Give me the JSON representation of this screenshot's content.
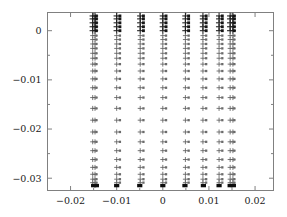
{
  "chart_data": {
    "type": "scatter",
    "title": "",
    "subtitle": "",
    "xlabel": "",
    "ylabel": "",
    "xlim": [
      -0.025,
      0.024
    ],
    "ylim": [
      -0.0325,
      0.0037
    ],
    "grid": false,
    "legend": null,
    "xticks": [
      -0.02,
      -0.01,
      0,
      0.01,
      0.02
    ],
    "xtick_labels": [
      "−0.02",
      "−0.01",
      "0",
      "0.01",
      "0.02"
    ],
    "yticks": [
      0,
      -0.01,
      -0.02,
      -0.03
    ],
    "ytick_labels": [
      "0",
      "−0.01",
      "−0.02",
      "−0.03"
    ],
    "minor_xticks": [
      -0.015,
      -0.005,
      0.005,
      0.015
    ],
    "minor_yticks": [
      -0.005,
      -0.015,
      -0.025
    ],
    "marker_styles": [
      "plus",
      "dot",
      "filled-square"
    ],
    "series": [
      {
        "name": "plus-columns",
        "marker": "plus",
        "x": [
          -0.0152,
          -0.0147,
          -0.01,
          -0.0049,
          0.0,
          0.0049,
          0.0087,
          0.0122,
          0.0146,
          0.0152
        ],
        "y_levels": [
          0.003,
          0.0024,
          0.0016,
          0.0008,
          0.0,
          -0.001,
          -0.0018,
          -0.0027,
          -0.0036,
          -0.0046,
          -0.0056,
          -0.0068,
          -0.0082,
          -0.0098,
          -0.0116,
          -0.0136,
          -0.0158,
          -0.0182,
          -0.0206,
          -0.0226,
          -0.0244,
          -0.0262,
          -0.0278,
          -0.0292,
          -0.0302,
          -0.0309
        ]
      },
      {
        "name": "dot-columns",
        "marker": "dot",
        "x": [
          -0.0144,
          -0.0093,
          -0.0042,
          0.0007,
          0.0056,
          0.0094,
          0.0129,
          0.0155
        ],
        "y_levels": [
          0.003,
          0.0024,
          0.0016,
          0.0008,
          0.0,
          -0.001,
          -0.0018,
          -0.0027,
          -0.0036,
          -0.0046,
          -0.0056,
          -0.0068,
          -0.0082,
          -0.0098,
          -0.0116,
          -0.0136,
          -0.0158,
          -0.0182,
          -0.0206,
          -0.0226,
          -0.0244,
          -0.0262,
          -0.0278,
          -0.0292,
          -0.0302,
          -0.0309
        ]
      },
      {
        "name": "baseline-squares",
        "marker": "filled-square",
        "x": [
          -0.015,
          -0.0144,
          -0.01,
          -0.005,
          0.0,
          0.0048,
          0.0088,
          0.0122,
          0.0146,
          0.0153
        ],
        "y": [
          -0.0315,
          -0.0315,
          -0.0315,
          -0.0315,
          -0.0315,
          -0.0315,
          -0.0315,
          -0.0315,
          -0.0315,
          -0.0315
        ]
      }
    ]
  },
  "axes": {
    "frame_color": "#808080",
    "marker_color": "#5f5f5f",
    "marker_dark_color": "#161616",
    "background": "#ffffff"
  }
}
